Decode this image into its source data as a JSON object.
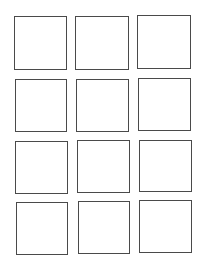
{
  "page": {
    "background": "#ffffff",
    "stroke_color": "#4a4a4a"
  },
  "grid": {
    "rows": 4,
    "columns": 3,
    "boxes": [
      {
        "row": 1,
        "col": 1,
        "x": 14,
        "y": 16,
        "w": 53,
        "h": 54,
        "label": ""
      },
      {
        "row": 1,
        "col": 2,
        "x": 75,
        "y": 16,
        "w": 54,
        "h": 54,
        "label": ""
      },
      {
        "row": 1,
        "col": 3,
        "x": 137,
        "y": 15,
        "w": 54,
        "h": 54,
        "label": ""
      },
      {
        "row": 2,
        "col": 1,
        "x": 15,
        "y": 79,
        "w": 52,
        "h": 53,
        "label": ""
      },
      {
        "row": 2,
        "col": 2,
        "x": 76,
        "y": 79,
        "w": 53,
        "h": 53,
        "label": ""
      },
      {
        "row": 2,
        "col": 3,
        "x": 138,
        "y": 78,
        "w": 53,
        "h": 53,
        "label": ""
      },
      {
        "row": 3,
        "col": 1,
        "x": 15,
        "y": 141,
        "w": 53,
        "h": 53,
        "label": ""
      },
      {
        "row": 3,
        "col": 2,
        "x": 77,
        "y": 140,
        "w": 53,
        "h": 53,
        "label": ""
      },
      {
        "row": 3,
        "col": 3,
        "x": 139,
        "y": 140,
        "w": 53,
        "h": 52,
        "label": ""
      },
      {
        "row": 4,
        "col": 1,
        "x": 16,
        "y": 202,
        "w": 52,
        "h": 53,
        "label": ""
      },
      {
        "row": 4,
        "col": 2,
        "x": 78,
        "y": 201,
        "w": 52,
        "h": 53,
        "label": ""
      },
      {
        "row": 4,
        "col": 3,
        "x": 139,
        "y": 200,
        "w": 53,
        "h": 53,
        "label": ""
      }
    ]
  }
}
